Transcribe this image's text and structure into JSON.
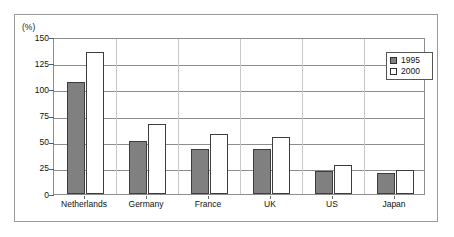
{
  "figure": {
    "unit_label": "(%)"
  },
  "legend": {
    "position": "inside-top-right",
    "entries": [
      {
        "label": "1995",
        "swatch": "filled-gray-square",
        "color": "#808080"
      },
      {
        "label": "2000",
        "swatch": "open-white-square",
        "color": "#ffffff"
      }
    ]
  },
  "axes": {
    "y_ticks": [
      "0",
      "25",
      "50",
      "75",
      "100",
      "125",
      "150"
    ],
    "x_ticks": [
      "Netherlands",
      "Germany",
      "France",
      "UK",
      "US",
      "Japan"
    ]
  },
  "chart_data": {
    "type": "bar",
    "title": "",
    "subtitle": "",
    "xlabel": "",
    "ylabel": "(%)",
    "ylim": [
      0,
      150
    ],
    "ytick_step": 25,
    "grid": true,
    "grid_axis": "y",
    "legend_position": "inside-top-right",
    "categories": [
      "Netherlands",
      "Germany",
      "France",
      "UK",
      "US",
      "Japan"
    ],
    "series": [
      {
        "name": "1995",
        "color": "#808080",
        "values": [
          107,
          51,
          43,
          43,
          22,
          20
        ]
      },
      {
        "name": "2000",
        "color": "#ffffff",
        "values": [
          136,
          67,
          57,
          54,
          28,
          23
        ]
      }
    ]
  }
}
